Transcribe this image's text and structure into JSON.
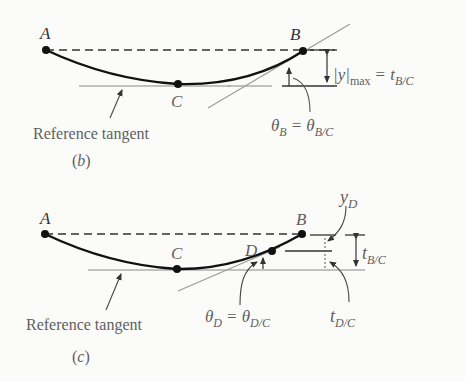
{
  "figure": {
    "panels": [
      {
        "id": "b",
        "caption": "(b)",
        "caption_letter": "b",
        "points": {
          "A": "A",
          "B": "B",
          "C": "C"
        },
        "reference_tangent_label": "Reference tangent",
        "deflection_label": {
          "abs_y": "|y|",
          "sub_max": "max",
          "eq": "=",
          "t": "t",
          "t_sub": "B/C"
        },
        "angle_label": {
          "theta": "θ",
          "theta_sub": "B",
          "eq": "=",
          "theta2": "θ",
          "theta2_sub": "B/C"
        }
      },
      {
        "id": "c",
        "caption": "(c)",
        "caption_letter": "c",
        "points": {
          "A": "A",
          "B": "B",
          "C": "C",
          "D": "D"
        },
        "reference_tangent_label": "Reference tangent",
        "yd_label": {
          "y": "y",
          "sub": "D"
        },
        "tbc_label": {
          "t": "t",
          "sub": "B/C"
        },
        "tdc_label": {
          "t": "t",
          "sub": "D/C"
        },
        "angle_label": {
          "theta": "θ",
          "theta_sub": "D",
          "eq": "=",
          "theta2": "θ",
          "theta2_sub": "D/C"
        }
      }
    ]
  }
}
